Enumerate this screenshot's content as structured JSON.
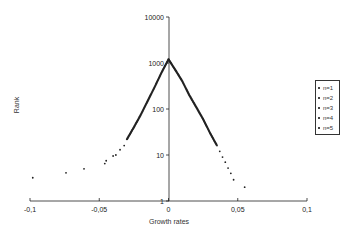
{
  "chart_data": {
    "type": "scatter",
    "title": "",
    "xlabel": "Growth rates",
    "ylabel": "Rank",
    "xlim": [
      -0.1,
      0.1
    ],
    "ylim": [
      1,
      10000
    ],
    "yscale": "log",
    "x_ticks": [
      "-0,1",
      "-0,05",
      "0",
      "0,05",
      "0,1"
    ],
    "y_ticks": [
      "1",
      "10",
      "100",
      "1000",
      "10000"
    ],
    "grid": false,
    "legend_position": "right",
    "legend": [
      "n=1",
      "n=2",
      "n=3",
      "n=4",
      "n=5"
    ],
    "series": [
      {
        "name": "n=1..5 (overlapping)",
        "points_negative_tail": [
          {
            "x": -0.098,
            "y": 3.2
          },
          {
            "x": -0.074,
            "y": 4.1
          },
          {
            "x": -0.061,
            "y": 5.0
          },
          {
            "x": -0.046,
            "y": 6.5
          },
          {
            "x": -0.045,
            "y": 7.5
          },
          {
            "x": -0.04,
            "y": 9.5
          },
          {
            "x": -0.038,
            "y": 10
          },
          {
            "x": -0.035,
            "y": 13
          },
          {
            "x": -0.032,
            "y": 16
          },
          {
            "x": -0.03,
            "y": 22
          },
          {
            "x": -0.025,
            "y": 40
          },
          {
            "x": -0.02,
            "y": 75
          },
          {
            "x": -0.015,
            "y": 150
          },
          {
            "x": -0.01,
            "y": 300
          },
          {
            "x": -0.005,
            "y": 620
          },
          {
            "x": 0.0,
            "y": 1200
          }
        ],
        "points_positive_tail": [
          {
            "x": 0.0,
            "y": 1200
          },
          {
            "x": 0.005,
            "y": 700
          },
          {
            "x": 0.01,
            "y": 400
          },
          {
            "x": 0.015,
            "y": 200
          },
          {
            "x": 0.02,
            "y": 110
          },
          {
            "x": 0.025,
            "y": 60
          },
          {
            "x": 0.03,
            "y": 30
          },
          {
            "x": 0.035,
            "y": 16
          },
          {
            "x": 0.037,
            "y": 12
          },
          {
            "x": 0.039,
            "y": 9
          },
          {
            "x": 0.041,
            "y": 7
          },
          {
            "x": 0.043,
            "y": 5.2
          },
          {
            "x": 0.045,
            "y": 4
          },
          {
            "x": 0.047,
            "y": 2.9
          },
          {
            "x": 0.055,
            "y": 2
          }
        ]
      }
    ]
  }
}
